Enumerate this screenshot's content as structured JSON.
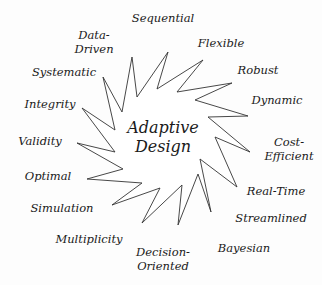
{
  "diagram": {
    "type": "starburst-concept",
    "center": {
      "line1": "Adaptive",
      "line2": "Design"
    },
    "labels": [
      {
        "id": "sequential",
        "lines": [
          "Sequential"
        ],
        "x": 163,
        "y": 18
      },
      {
        "id": "flexible",
        "lines": [
          "Flexible"
        ],
        "x": 221,
        "y": 43
      },
      {
        "id": "robust",
        "lines": [
          "Robust"
        ],
        "x": 258,
        "y": 70
      },
      {
        "id": "dynamic",
        "lines": [
          "Dynamic"
        ],
        "x": 277,
        "y": 100
      },
      {
        "id": "cost-efficient",
        "lines": [
          "Cost-",
          "Efficient"
        ],
        "x": 289,
        "y": 149
      },
      {
        "id": "real-time",
        "lines": [
          "Real-Time"
        ],
        "x": 276,
        "y": 191
      },
      {
        "id": "streamlined",
        "lines": [
          "Streamlined"
        ],
        "x": 271,
        "y": 218
      },
      {
        "id": "bayesian",
        "lines": [
          "Bayesian"
        ],
        "x": 244,
        "y": 248
      },
      {
        "id": "decision-oriented",
        "lines": [
          "Decision-",
          "Oriented"
        ],
        "x": 163,
        "y": 259
      },
      {
        "id": "multiplicity",
        "lines": [
          "Multiplicity"
        ],
        "x": 89,
        "y": 239
      },
      {
        "id": "simulation",
        "lines": [
          "Simulation"
        ],
        "x": 62,
        "y": 208
      },
      {
        "id": "optimal",
        "lines": [
          "Optimal"
        ],
        "x": 48,
        "y": 176
      },
      {
        "id": "validity",
        "lines": [
          "Validity"
        ],
        "x": 40,
        "y": 141
      },
      {
        "id": "integrity",
        "lines": [
          "Integrity"
        ],
        "x": 50,
        "y": 104
      },
      {
        "id": "systematic",
        "lines": [
          "Systematic"
        ],
        "x": 64,
        "y": 72
      },
      {
        "id": "data-driven",
        "lines": [
          "Data-",
          "Driven"
        ],
        "x": 94,
        "y": 42
      }
    ],
    "star": {
      "stroke": "#333333",
      "fill": "#ffffff",
      "points": "132,57 137,97 168,52 157,89 203,60 177,92 232,83 195,100 248,116 208,117 250,152 215,137 237,187 200,159 211,212 198,174 178,225 182,185 142,223 160,188 112,205 142,183 87,179 123,169 77,143 115,152 82,108 115,130 103,77 122,112"
    }
  }
}
